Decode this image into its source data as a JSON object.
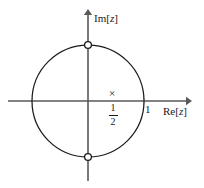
{
  "figure": {
    "width": 204,
    "height": 188,
    "background_color": "#ffffff",
    "ink_color": "#1a1a1a",
    "axis_color": "#4d4d4d"
  },
  "axes": {
    "imaginary": {
      "label_prefix": "Im",
      "label_open_bracket": "[",
      "label_variable": "z",
      "label_close_bracket": "]",
      "label_full": "Im[z]",
      "orientation": "vertical",
      "arrow": "up",
      "origin_x": 88,
      "top_y": 10,
      "bottom_y": 180
    },
    "real": {
      "label_prefix": "Re",
      "label_open_bracket": "[",
      "label_variable": "z",
      "label_close_bracket": "]",
      "label_full": "Re[z]",
      "orientation": "horizontal",
      "arrow": "right",
      "origin_y": 101,
      "left_x": 8,
      "right_x": 191
    }
  },
  "ticks": [
    {
      "name": "unit-real-tick",
      "label": "1",
      "axis": "real",
      "value": 1,
      "x": 144,
      "y": 101
    }
  ],
  "circle": {
    "name": "unit-circle",
    "center_x": 88,
    "center_y": 101,
    "radius": 56,
    "radius_value": 1,
    "stroke_color": "#1a1a1a",
    "stroke_width": 1,
    "fill": "none"
  },
  "markers": {
    "zeros": [
      {
        "name": "zero-marker-plus-i",
        "glyph": "open-circle",
        "value": "i",
        "x": 88,
        "y": 45,
        "fill": "#ffffff",
        "stroke": "#1a1a1a",
        "radius": 3.2
      },
      {
        "name": "zero-marker-minus-i",
        "glyph": "open-circle",
        "value": "-i",
        "x": 88,
        "y": 157,
        "fill": "#ffffff",
        "stroke": "#1a1a1a",
        "radius": 3.2
      }
    ],
    "pole": {
      "name": "pole-marker-one-half",
      "glyph": "x",
      "symbol": "×",
      "value": "1/2",
      "numerator": "1",
      "denominator": "2",
      "x": 113,
      "y": 95
    }
  }
}
